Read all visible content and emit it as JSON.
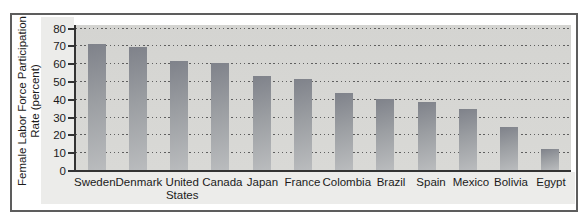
{
  "figure": {
    "kind": "textbook bar chart figure",
    "title": ""
  },
  "colors": {
    "frame_border": "#5d5d5d",
    "panel_background": "#ececea",
    "plot_background": "#d6d6d3",
    "axis_line": "#333333",
    "gridline_dots": "#5f5f5f",
    "bar_gradient_top": "#7f828a",
    "bar_gradient_bottom": "#babcbe",
    "text": "#1b1b1b"
  },
  "chart_data": {
    "type": "bar",
    "title": "",
    "ylabel": "Female Labor Force Participation Rate (percent)",
    "ylabel_lines": [
      "Female Labor Force Participation",
      "Rate (percent)"
    ],
    "xlabel": "",
    "categories": [
      "Sweden",
      "Denmark",
      "United States",
      "Canada",
      "Japan",
      "France",
      "Colombia",
      "Brazil",
      "Spain",
      "Mexico",
      "Bolivia",
      "Egypt"
    ],
    "category_label_lines": [
      [
        "Sweden"
      ],
      [
        "Denmark"
      ],
      [
        "United",
        "States"
      ],
      [
        "Canada"
      ],
      [
        "Japan"
      ],
      [
        "France"
      ],
      [
        "Colombia"
      ],
      [
        "Brazil"
      ],
      [
        "Spain"
      ],
      [
        "Mexico"
      ],
      [
        "Bolivia"
      ],
      [
        "Egypt"
      ]
    ],
    "values": [
      71,
      69,
      61,
      60,
      53,
      51,
      43,
      40,
      38,
      34,
      24,
      12
    ],
    "ylim": [
      0,
      80
    ],
    "yticks": [
      0,
      10,
      20,
      30,
      40,
      50,
      60,
      70,
      80
    ],
    "grid": "dotted-horizontal",
    "legend": "none"
  }
}
